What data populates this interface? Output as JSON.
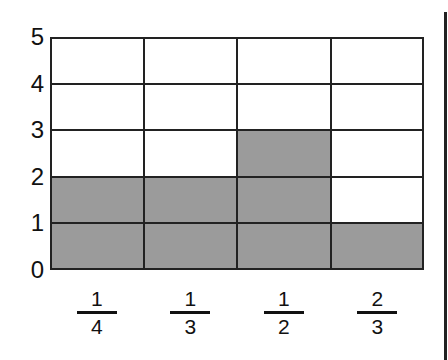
{
  "chart_data": {
    "type": "bar",
    "title": "",
    "xlabel": "",
    "ylabel": "",
    "categories": [
      "1/4",
      "1/3",
      "1/2",
      "2/3"
    ],
    "category_fractions": [
      {
        "numerator": "1",
        "denominator": "4"
      },
      {
        "numerator": "1",
        "denominator": "3"
      },
      {
        "numerator": "1",
        "denominator": "2"
      },
      {
        "numerator": "2",
        "denominator": "3"
      }
    ],
    "values": [
      2,
      2,
      3,
      1
    ],
    "ylim": [
      0,
      5
    ],
    "yticks": [
      "0",
      "1",
      "2",
      "3",
      "4",
      "5"
    ],
    "grid": true,
    "style": "shaded grid cells (bar graph on grid)",
    "fill_color": "#a9a9a9"
  }
}
